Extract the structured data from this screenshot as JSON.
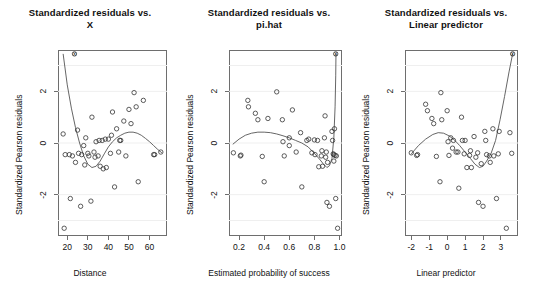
{
  "chart_data": [
    {
      "type": "scatter",
      "panel_index": 0,
      "title_line1": "Standardized residuals vs.",
      "title_line2": "X",
      "xlabel": "Distance",
      "ylabel": "Standardized Pearson residuals",
      "xlim": [
        15.5,
        68.5
      ],
      "ylim": [
        -3.6,
        3.6
      ],
      "xticks": [
        20,
        30,
        40,
        50,
        60
      ],
      "xtick_labels": [
        "20",
        "30",
        "40",
        "50",
        "60"
      ],
      "yticks": [
        -2,
        0,
        2
      ],
      "ytick_labels": [
        "-2",
        "0",
        "2"
      ],
      "grid": true,
      "points": [
        [
          18.0,
          0.35
        ],
        [
          19.0,
          -0.45
        ],
        [
          21.0,
          -0.45
        ],
        [
          21.5,
          -2.15
        ],
        [
          22.5,
          -0.5
        ],
        [
          24.0,
          -0.75
        ],
        [
          25.0,
          0.5
        ],
        [
          25.5,
          -0.4
        ],
        [
          26.5,
          -2.45
        ],
        [
          27.0,
          -0.45
        ],
        [
          28.0,
          -0.1
        ],
        [
          28.5,
          -0.85
        ],
        [
          29.0,
          0.2
        ],
        [
          30.0,
          -0.4
        ],
        [
          30.5,
          -0.5
        ],
        [
          31.5,
          -2.25
        ],
        [
          32.0,
          1.0
        ],
        [
          33.0,
          -0.35
        ],
        [
          33.5,
          -0.55
        ],
        [
          34.0,
          0.05
        ],
        [
          35.0,
          -0.5
        ],
        [
          35.5,
          0.1
        ],
        [
          36.0,
          -0.9
        ],
        [
          37.0,
          0.1
        ],
        [
          37.5,
          -1.0
        ],
        [
          38.5,
          0.15
        ],
        [
          39.0,
          -0.95
        ],
        [
          40.0,
          0.15
        ],
        [
          41.0,
          -0.4
        ],
        [
          41.5,
          0.3
        ],
        [
          42.0,
          1.2
        ],
        [
          43.0,
          -1.7
        ],
        [
          44.0,
          0.55
        ],
        [
          45.0,
          -0.35
        ],
        [
          45.5,
          0.1
        ],
        [
          46.0,
          0.1
        ],
        [
          47.5,
          0.85
        ],
        [
          48.5,
          -0.5
        ],
        [
          50.0,
          1.3
        ],
        [
          51.0,
          0.75
        ],
        [
          52.5,
          1.95
        ],
        [
          53.5,
          1.4
        ],
        [
          54.5,
          -1.5
        ],
        [
          57.0,
          1.65
        ],
        [
          62.0,
          -0.45
        ],
        [
          62.5,
          -0.45
        ],
        [
          65.5,
          -0.35
        ],
        [
          18.5,
          -3.3
        ],
        [
          23.5,
          3.45
        ]
      ],
      "loess_x": [
        18.0,
        20.0,
        22.0,
        24.0,
        26.0,
        28.0,
        30.0,
        32.0,
        34.0,
        36.0,
        38.0,
        40.0,
        42.0,
        44.0,
        46.0,
        48.0,
        50.0,
        52.0,
        54.0,
        56.0,
        58.0,
        60.0,
        62.0,
        64.0,
        66.0
      ],
      "loess_y": [
        3.45,
        2.25,
        1.35,
        0.6,
        0.0,
        -0.5,
        -0.82,
        -0.95,
        -0.9,
        -0.7,
        -0.42,
        -0.15,
        0.05,
        0.2,
        0.3,
        0.38,
        0.42,
        0.42,
        0.38,
        0.3,
        0.18,
        0.05,
        -0.1,
        -0.25,
        -0.38
      ],
      "marker_x_point": [
        23.5,
        3.45
      ]
    },
    {
      "type": "scatter",
      "panel_index": 1,
      "title_line1": "Standardized residuals vs.",
      "title_line2": "pi.hat",
      "xlabel": "Estimated probability of success",
      "ylabel": "Standardized Pearson residuals",
      "xlim": [
        0.12,
        1.02
      ],
      "ylim": [
        -3.6,
        3.6
      ],
      "xticks": [
        0.2,
        0.4,
        0.6,
        0.8,
        1.0
      ],
      "xtick_labels": [
        "0.2",
        "0.4",
        "0.6",
        "0.8",
        "1.0"
      ],
      "yticks": [
        -2,
        0,
        2
      ],
      "ytick_labels": [
        "-2",
        "0",
        "2"
      ],
      "grid": true,
      "points": [
        [
          0.155,
          -0.38
        ],
        [
          0.21,
          -0.5
        ],
        [
          0.215,
          -0.47
        ],
        [
          0.27,
          1.65
        ],
        [
          0.275,
          1.4
        ],
        [
          0.33,
          1.15
        ],
        [
          0.35,
          0.9
        ],
        [
          0.385,
          -0.52
        ],
        [
          0.4,
          -1.5
        ],
        [
          0.43,
          0.95
        ],
        [
          0.5,
          1.98
        ],
        [
          0.545,
          0.9
        ],
        [
          0.55,
          0.05
        ],
        [
          0.56,
          -0.5
        ],
        [
          0.6,
          0.2
        ],
        [
          0.625,
          1.28
        ],
        [
          0.655,
          -0.35
        ],
        [
          0.69,
          0.4
        ],
        [
          0.7,
          -1.7
        ],
        [
          0.755,
          0.15
        ],
        [
          0.78,
          -0.38
        ],
        [
          0.8,
          0.12
        ],
        [
          0.805,
          -0.45
        ],
        [
          0.825,
          0.1
        ],
        [
          0.835,
          -0.92
        ],
        [
          0.855,
          -0.5
        ],
        [
          0.86,
          -0.3
        ],
        [
          0.865,
          -0.9
        ],
        [
          0.885,
          1.05
        ],
        [
          0.89,
          -0.55
        ],
        [
          0.895,
          -0.35
        ],
        [
          0.9,
          -2.3
        ],
        [
          0.905,
          -0.75
        ],
        [
          0.92,
          -2.45
        ],
        [
          0.94,
          0.45
        ],
        [
          0.945,
          0.1
        ],
        [
          0.95,
          -0.42
        ],
        [
          0.955,
          -0.45
        ],
        [
          0.955,
          -0.7
        ],
        [
          0.96,
          0.55
        ],
        [
          0.965,
          -0.48
        ],
        [
          0.97,
          -2.15
        ],
        [
          0.975,
          -0.5
        ],
        [
          0.985,
          -3.3
        ],
        [
          0.6,
          -0.1
        ],
        [
          0.74,
          0.1
        ],
        [
          0.88,
          0.2
        ],
        [
          0.97,
          3.45
        ]
      ],
      "loess_x": [
        0.15,
        0.2,
        0.25,
        0.3,
        0.35,
        0.4,
        0.45,
        0.5,
        0.55,
        0.6,
        0.65,
        0.7,
        0.75,
        0.8,
        0.84,
        0.87,
        0.9,
        0.92,
        0.94,
        0.955,
        0.965,
        0.97,
        0.972
      ],
      "loess_y": [
        -0.05,
        0.15,
        0.3,
        0.38,
        0.42,
        0.42,
        0.4,
        0.35,
        0.28,
        0.2,
        0.1,
        0.0,
        -0.15,
        -0.4,
        -0.62,
        -0.8,
        -0.95,
        -0.88,
        -0.6,
        0.2,
        1.4,
        2.6,
        3.45
      ],
      "marker_x_point": [
        0.97,
        3.45
      ]
    },
    {
      "type": "scatter",
      "panel_index": 2,
      "title_line1": "Standardized residuals vs.",
      "title_line2": "Linear predictor",
      "xlabel": "Linear predictor",
      "ylabel": "Standardized Pearson residuals",
      "xlim": [
        -2.35,
        3.95
      ],
      "ylim": [
        -3.6,
        3.6
      ],
      "xticks": [
        -2,
        -1,
        0,
        1,
        2,
        3
      ],
      "xtick_labels": [
        "-2",
        "-1",
        "0",
        "1",
        "2",
        "3"
      ],
      "yticks": [
        -2,
        0,
        2
      ],
      "ytick_labels": [
        "-2",
        "0",
        "2"
      ],
      "grid": true,
      "points": [
        [
          -2.0,
          -0.38
        ],
        [
          -1.7,
          -0.48
        ],
        [
          -1.65,
          -0.45
        ],
        [
          -1.2,
          1.5
        ],
        [
          -1.1,
          1.25
        ],
        [
          -0.85,
          0.95
        ],
        [
          -0.75,
          0.75
        ],
        [
          -0.6,
          -0.52
        ],
        [
          -0.4,
          -1.5
        ],
        [
          -0.35,
          1.95
        ],
        [
          -0.3,
          0.9
        ],
        [
          0.0,
          1.25
        ],
        [
          0.05,
          0.05
        ],
        [
          0.1,
          -0.48
        ],
        [
          0.2,
          0.2
        ],
        [
          0.3,
          -0.2
        ],
        [
          0.35,
          0.1
        ],
        [
          0.5,
          -0.35
        ],
        [
          0.6,
          -0.35
        ],
        [
          0.65,
          -1.75
        ],
        [
          0.8,
          1.0
        ],
        [
          0.85,
          0.1
        ],
        [
          0.95,
          -0.42
        ],
        [
          1.0,
          0.1
        ],
        [
          1.1,
          -0.95
        ],
        [
          1.25,
          -0.48
        ],
        [
          1.3,
          -0.3
        ],
        [
          1.35,
          -0.95
        ],
        [
          1.5,
          0.25
        ],
        [
          1.6,
          -0.55
        ],
        [
          1.7,
          -0.38
        ],
        [
          1.75,
          -2.3
        ],
        [
          1.9,
          -0.8
        ],
        [
          2.0,
          -2.45
        ],
        [
          2.1,
          0.45
        ],
        [
          2.15,
          0.1
        ],
        [
          2.2,
          -0.45
        ],
        [
          2.35,
          -0.5
        ],
        [
          2.4,
          -0.75
        ],
        [
          2.55,
          0.55
        ],
        [
          2.6,
          -0.5
        ],
        [
          2.75,
          -2.15
        ],
        [
          2.85,
          -0.42
        ],
        [
          3.3,
          -3.3
        ],
        [
          2.9,
          0.45
        ],
        [
          3.5,
          0.4
        ],
        [
          3.6,
          -0.4
        ],
        [
          3.65,
          3.45
        ]
      ],
      "loess_x": [
        -2.0,
        -1.6,
        -1.2,
        -0.8,
        -0.5,
        -0.2,
        0.1,
        0.4,
        0.7,
        1.0,
        1.3,
        1.55,
        1.8,
        2.0,
        2.2,
        2.45,
        2.7,
        2.95,
        3.2,
        3.45,
        3.65
      ],
      "loess_y": [
        -0.42,
        -0.1,
        0.15,
        0.33,
        0.4,
        0.38,
        0.28,
        0.12,
        -0.1,
        -0.35,
        -0.6,
        -0.82,
        -0.95,
        -0.9,
        -0.7,
        -0.4,
        0.1,
        0.9,
        1.8,
        2.75,
        3.45
      ],
      "marker_x_point": [
        3.65,
        3.45
      ]
    }
  ],
  "panels": [
    {
      "title_line1": "Standardized residuals vs.",
      "title_line2": "X",
      "xlabel": "Distance",
      "ylabel": "Standardized Pearson residuals",
      "xtick_labels": [
        "20",
        "30",
        "40",
        "50",
        "60"
      ],
      "ytick_labels": [
        "2",
        "0",
        "-2"
      ]
    },
    {
      "title_line1": "Standardized residuals vs.",
      "title_line2": "pi.hat",
      "xlabel": "Estimated probability of success",
      "ylabel": "Standardized Pearson residuals",
      "xtick_labels": [
        "0.2",
        "0.4",
        "0.6",
        "0.8",
        "1.0"
      ],
      "ytick_labels": [
        "2",
        "0",
        "-2"
      ]
    },
    {
      "title_line1": "Standardized residuals vs.",
      "title_line2": "Linear predictor",
      "xlabel": "Linear predictor",
      "ylabel": "Standardized Pearson residuals",
      "xtick_labels": [
        "-2",
        "-1",
        "0",
        "1",
        "2",
        "3"
      ],
      "ytick_labels": [
        "2",
        "0",
        "-2"
      ]
    }
  ],
  "colors": {
    "background": "#ffffff",
    "axis": "#6e6e6e",
    "point": "#333333",
    "line": "#555555",
    "grid": "#efefef",
    "text": "#111111"
  }
}
